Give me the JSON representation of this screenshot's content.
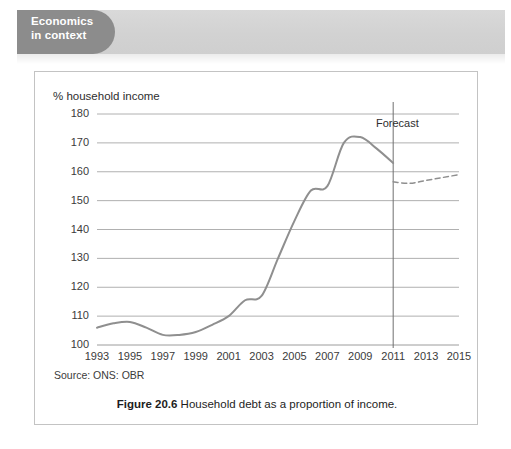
{
  "header": {
    "tab_line1": "Economics",
    "tab_line2": "in context",
    "tab_color": "#8c8c8c",
    "band_color": "#d4d4d4"
  },
  "figure": {
    "caption_label": "Figure 20.6",
    "caption_text": "Household debt as a proportion of income.",
    "source": "Source: ONS: OBR"
  },
  "chart_data": {
    "type": "line",
    "title": "",
    "ylabel": "% household income",
    "xlabel": "",
    "ylim": [
      100,
      180
    ],
    "xlim": [
      1993,
      2015
    ],
    "grid": true,
    "legend": false,
    "ytick_labels": [
      "180",
      "170",
      "160",
      "150",
      "140",
      "130",
      "120",
      "110",
      "100"
    ],
    "ytick_values": [
      180,
      170,
      160,
      150,
      140,
      130,
      120,
      110,
      100
    ],
    "xtick_labels": [
      "1993",
      "1995",
      "1997",
      "1999",
      "2001",
      "2003",
      "2005",
      "2007",
      "2009",
      "2011",
      "2013",
      "2015"
    ],
    "xtick_values": [
      1993,
      1995,
      1997,
      1999,
      2001,
      2003,
      2005,
      2007,
      2009,
      2011,
      2013,
      2015
    ],
    "line_color": "#8f8f8f",
    "annotations": [
      {
        "name": "forecast-divider",
        "text": "Forecast",
        "x": 2011,
        "style": "vertical-line"
      }
    ],
    "series": [
      {
        "name": "Household debt (% of household income) — actual",
        "style": "solid",
        "x": [
          1993,
          1994,
          1995,
          1996,
          1997,
          1998,
          1999,
          2000,
          2001,
          2002,
          2003,
          2004,
          2005,
          2006,
          2007,
          2008,
          2009,
          2010,
          2011
        ],
        "values": [
          106,
          107.5,
          108,
          106,
          103.5,
          103.5,
          104.5,
          107,
          110,
          115.5,
          117,
          130,
          143,
          153.5,
          155,
          170,
          172,
          168,
          163
        ]
      },
      {
        "name": "Household debt (% of household income) — forecast",
        "style": "dashed",
        "x": [
          2011,
          2012,
          2013,
          2014,
          2015
        ],
        "values": [
          156.5,
          156,
          157,
          158,
          159
        ]
      }
    ]
  }
}
